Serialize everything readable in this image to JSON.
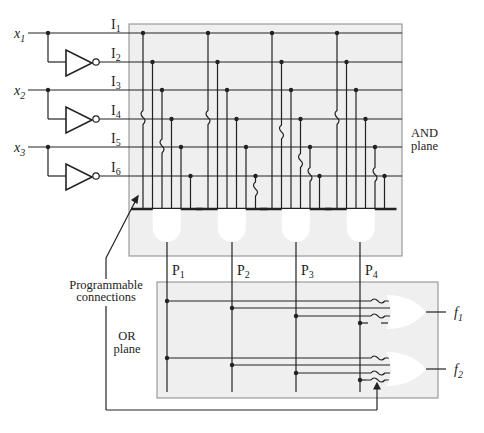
{
  "diagram": {
    "type": "Programmable Logic Array (PLA)",
    "inputs": [
      {
        "name": "x",
        "sub": "1"
      },
      {
        "name": "x",
        "sub": "2"
      },
      {
        "name": "x",
        "sub": "3"
      }
    ],
    "lines": [
      {
        "name": "I",
        "sub": "1"
      },
      {
        "name": "I",
        "sub": "2"
      },
      {
        "name": "I",
        "sub": "3"
      },
      {
        "name": "I",
        "sub": "4"
      },
      {
        "name": "I",
        "sub": "5"
      },
      {
        "name": "I",
        "sub": "6"
      }
    ],
    "products": [
      {
        "name": "P",
        "sub": "1"
      },
      {
        "name": "P",
        "sub": "2"
      },
      {
        "name": "P",
        "sub": "3"
      },
      {
        "name": "P",
        "sub": "4"
      }
    ],
    "outputs": [
      {
        "name": "f",
        "sub": "1"
      },
      {
        "name": "f",
        "sub": "2"
      }
    ],
    "and_plane_label": [
      "AND",
      "plane"
    ],
    "or_plane_label": [
      "OR",
      "plane"
    ],
    "programmable_label": [
      "Programmable",
      "connections"
    ],
    "and_blown_fuses": [
      [
        0,
        2
      ],
      [
        0,
        5
      ],
      [
        1,
        3,
        4
      ],
      [
        0,
        4
      ]
    ],
    "or_connections": {
      "f1": {
        "squiggle": [
          0,
          2
        ],
        "straight": [
          1
        ],
        "open": [
          3
        ]
      },
      "f2": {
        "squiggle": [
          0,
          2,
          3
        ],
        "straight": [
          1
        ],
        "open": []
      }
    },
    "colors": {
      "plane_fill": "#efefef",
      "plane_border": "#9a9a9a",
      "wire": "#222222"
    }
  }
}
